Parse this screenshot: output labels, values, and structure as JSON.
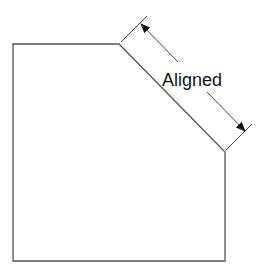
{
  "diagram": {
    "dimension_label": "Aligned",
    "colors": {
      "outline": "#555555",
      "dimension": "#444444",
      "arrow": "#111111",
      "text": "#111111",
      "background": "#ffffff"
    },
    "shape": {
      "type": "polygon",
      "description": "rectangle with chamfered top-right corner",
      "vertices": [
        [
          13,
          44
        ],
        [
          119,
          44
        ],
        [
          225,
          152
        ],
        [
          225,
          261
        ],
        [
          13,
          261
        ]
      ]
    },
    "dimension": {
      "type": "aligned",
      "measured_edge": [
        [
          119,
          44
        ],
        [
          225,
          152
        ]
      ],
      "extension_lines": [
        [
          [
            121,
            42
          ],
          [
            147,
            16
          ]
        ],
        [
          [
            226,
            150
          ],
          [
            252,
            124
          ]
        ]
      ],
      "dimension_line_points": [
        [
          141,
          24
        ],
        [
          246,
          132
        ]
      ]
    }
  }
}
